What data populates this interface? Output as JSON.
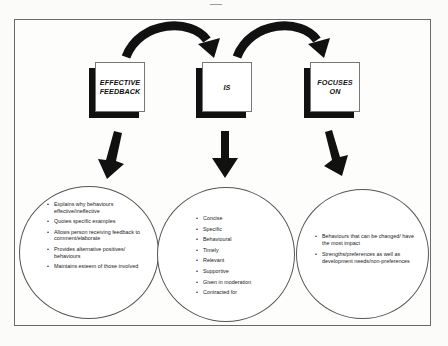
{
  "diagram": {
    "title_boxes": [
      {
        "id": "effective-feedback",
        "label_line1": "EFFECTIVE",
        "label_line2": "FEEDBACK"
      },
      {
        "id": "is",
        "label_line1": "IS",
        "label_line2": ""
      },
      {
        "id": "focuses-on",
        "label_line1": "FOCUSES",
        "label_line2": "ON"
      }
    ],
    "circles": [
      {
        "id": "effective-feedback-details",
        "items": [
          "Explains why behaviours effective/ineffective",
          "Quotes specific examples",
          "Allows person receiving feedback to comment/elaborate",
          "Provides alternative positives/ behaviours",
          "Maintains esteem of those involved"
        ]
      },
      {
        "id": "is-details",
        "items": [
          "Concise",
          "Specific",
          "Behavioural",
          "Timely",
          "Relevant",
          "Supportive",
          "Given in moderation",
          "Contracted for"
        ]
      },
      {
        "id": "focuses-on-details",
        "items": [
          "Behaviours that can be changed/ have the most impact",
          "Strengths/preferences as well as development needs/non-preferences"
        ]
      }
    ],
    "colors": {
      "arrow": "#111111",
      "shadow": "#111111",
      "frame": "#6a6a6a",
      "background": "#fbfbfa"
    }
  }
}
